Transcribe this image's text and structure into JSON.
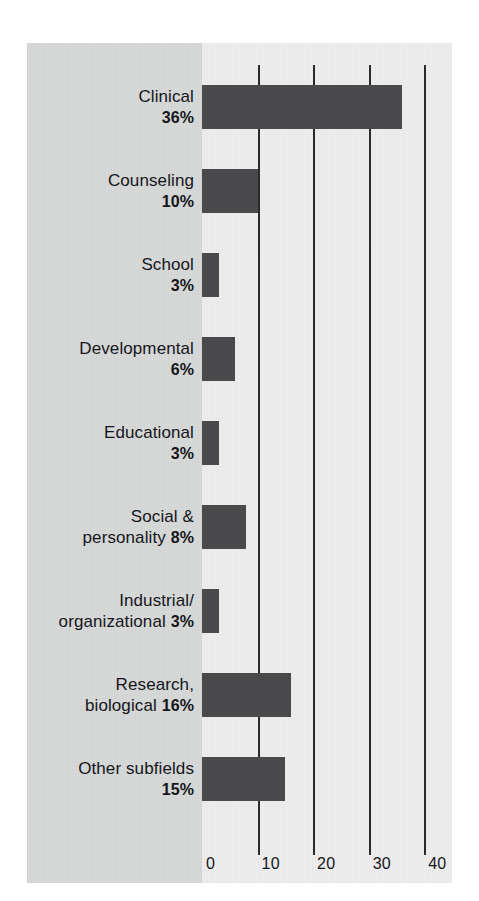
{
  "chart_data": {
    "type": "bar",
    "orientation": "horizontal",
    "title": "",
    "subtitle": "",
    "xlabel": "",
    "ylabel": "",
    "categories": [
      "Clinical",
      "Counseling",
      "School",
      "Developmental",
      "Educational",
      "Social & personality",
      "Industrial/ organizational",
      "Research, biological",
      "Other subfields"
    ],
    "values": [
      36,
      10,
      3,
      6,
      3,
      8,
      3,
      16,
      15
    ],
    "value_unit": "percent",
    "xlim": [
      0,
      45
    ],
    "xticks": [
      0,
      10,
      20,
      30,
      40
    ],
    "xtick_labels": [
      "0",
      "10",
      "20",
      "30",
      "40"
    ],
    "grid": "vertical-only",
    "gridlines_at": [
      10,
      20,
      30,
      40
    ],
    "legend": "none",
    "bar_color": "#4a4a4c",
    "label_panel_color": "#d7d8d8",
    "plot_background_color": "#ededee",
    "axis_color": "#2b2b2b"
  },
  "rows": [
    {
      "name": "Clinical",
      "line1": "Clinical",
      "line2": "",
      "pct": "36%",
      "value": 36
    },
    {
      "name": "Counseling",
      "line1": "Counseling",
      "line2": "",
      "pct": "10%",
      "value": 10
    },
    {
      "name": "School",
      "line1": "School",
      "line2": "",
      "pct": "3%",
      "value": 3
    },
    {
      "name": "Developmental",
      "line1": "Developmental",
      "line2": "",
      "pct": "6%",
      "value": 6
    },
    {
      "name": "Educational",
      "line1": "Educational",
      "line2": "",
      "pct": "3%",
      "value": 3
    },
    {
      "name": "Social",
      "line1": "Social &",
      "line2": "personality",
      "pct": "8%",
      "value": 8
    },
    {
      "name": "Industrial",
      "line1": "Industrial/",
      "line2": "organizational",
      "pct": "3%",
      "value": 3
    },
    {
      "name": "Research",
      "line1": "Research,",
      "line2": "biological",
      "pct": "16%",
      "value": 16
    },
    {
      "name": "OtherSubfields",
      "line1": "Other subfields",
      "line2": "",
      "pct": "15%",
      "value": 15
    }
  ],
  "axis": {
    "ticks": [
      {
        "label": "0",
        "value": 0
      },
      {
        "label": "10",
        "value": 10
      },
      {
        "label": "20",
        "value": 20
      },
      {
        "label": "30",
        "value": 30
      },
      {
        "label": "40",
        "value": 40
      }
    ]
  }
}
